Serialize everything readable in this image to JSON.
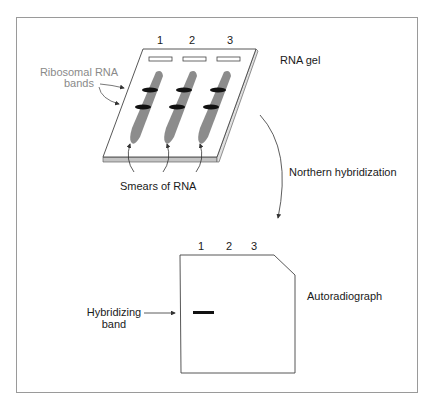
{
  "gel": {
    "title": "RNA gel",
    "lanes": [
      "1",
      "2",
      "3"
    ],
    "ribosomal_label_line1": "Ribosomal RNA",
    "ribosomal_label_line2": "bands",
    "smears_label": "Smears of RNA"
  },
  "process": {
    "label": "Northern hybridization"
  },
  "autoradiograph": {
    "title": "Autoradiograph",
    "lanes": [
      "1",
      "2",
      "3"
    ],
    "band_label_line1": "Hybridizing",
    "band_label_line2": "band"
  },
  "colors": {
    "smear": "#8c8c8c",
    "band": "#111111",
    "gel_edge": "#b8b8b8",
    "outline": "#555555",
    "label_grey": "#8a8a8a"
  }
}
